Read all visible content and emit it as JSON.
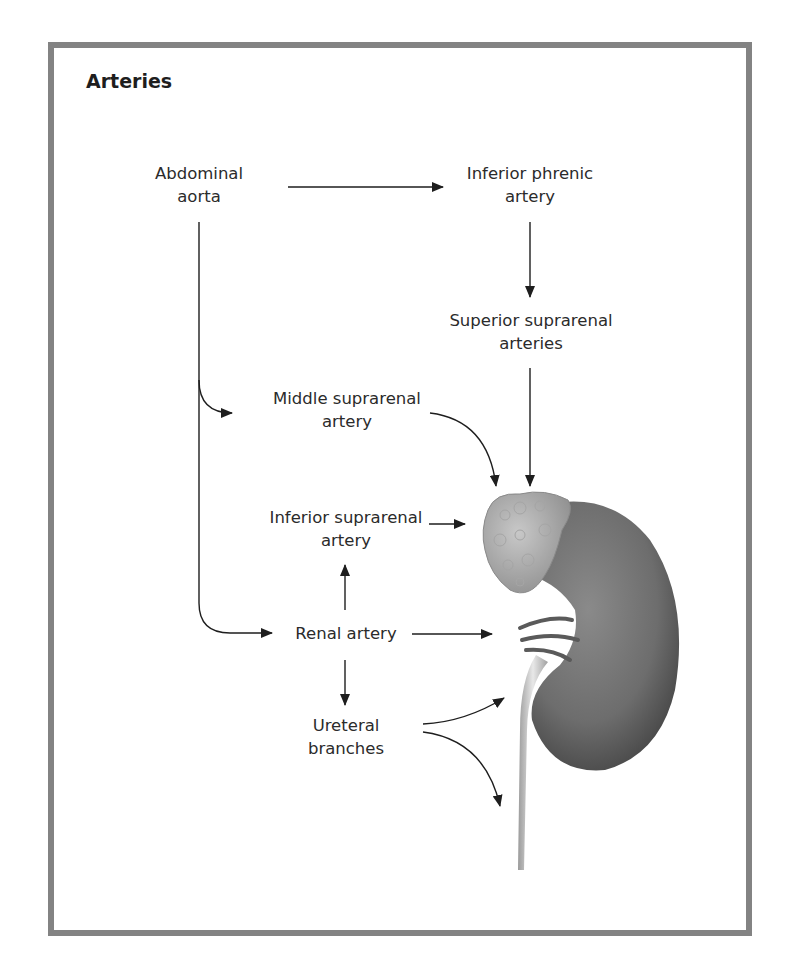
{
  "figure": {
    "title": "Arteries",
    "border_color": "#838383",
    "nodes": {
      "abdominal_aorta": {
        "line1": "Abdominal",
        "line2": "aorta"
      },
      "inferior_phrenic": {
        "line1": "Inferior phrenic",
        "line2": "artery"
      },
      "superior_suprarenal": {
        "line1": "Superior suprarenal",
        "line2": "arteries"
      },
      "middle_suprarenal": {
        "line1": "Middle suprarenal",
        "line2": "artery"
      },
      "inferior_suprarenal": {
        "line1": "Inferior suprarenal",
        "line2": "artery"
      },
      "renal_artery": {
        "line1": "Renal artery"
      },
      "ureteral_branches": {
        "line1": "Ureteral",
        "line2": "branches"
      }
    },
    "illustration": "kidney-with-suprarenal-gland-and-ureter"
  }
}
